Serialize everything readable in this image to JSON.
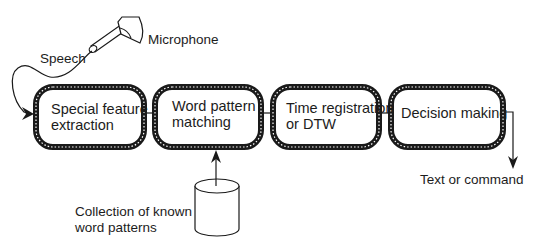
{
  "diagram": {
    "input": {
      "microphone_label": "Microphone",
      "speech_label": "Speech"
    },
    "stages": [
      {
        "line1": "Special feature",
        "line2": "extraction"
      },
      {
        "line1": "Word pattern",
        "line2": "matching"
      },
      {
        "line1": "Time registration",
        "line2": "or DTW"
      },
      {
        "line1": "Decision making",
        "line2": ""
      }
    ],
    "database": {
      "line1": "Collection of known",
      "line2": "word patterns"
    },
    "output": {
      "label": "Text or command"
    },
    "colors": {
      "stroke": "#1a1a1a",
      "border_hatch": "#ffffff",
      "background": "#ffffff"
    }
  }
}
